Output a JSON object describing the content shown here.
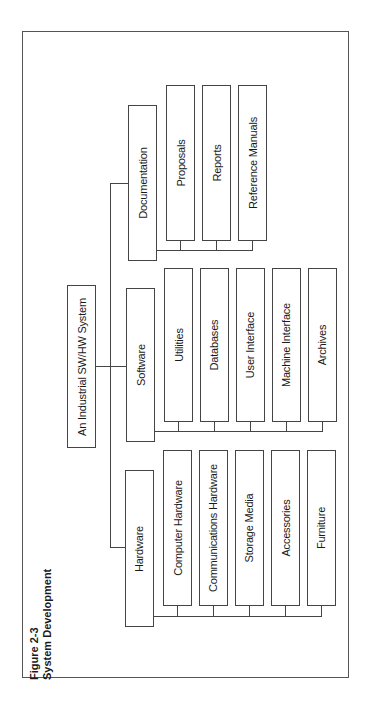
{
  "caption": {
    "figure_number": "Figure 2-3",
    "title": "System Development"
  },
  "root": {
    "label": "An Industrial SW/HW System"
  },
  "branches": {
    "hardware": {
      "label": "Hardware",
      "children": [
        "Computer Hardware",
        "Communications Hardware",
        "Storage Media",
        "Accessories",
        "Furniture"
      ]
    },
    "software": {
      "label": "Software",
      "children": [
        "Utilities",
        "Databases",
        "User Interface",
        "Machine Interface",
        "Archives"
      ]
    },
    "documentation": {
      "label": "Documentation",
      "children": [
        "Proposals",
        "Reports",
        "Reference Manuals"
      ]
    }
  },
  "colors": {
    "line": "#444444",
    "background": "#ffffff",
    "text": "#1a1a1a"
  }
}
